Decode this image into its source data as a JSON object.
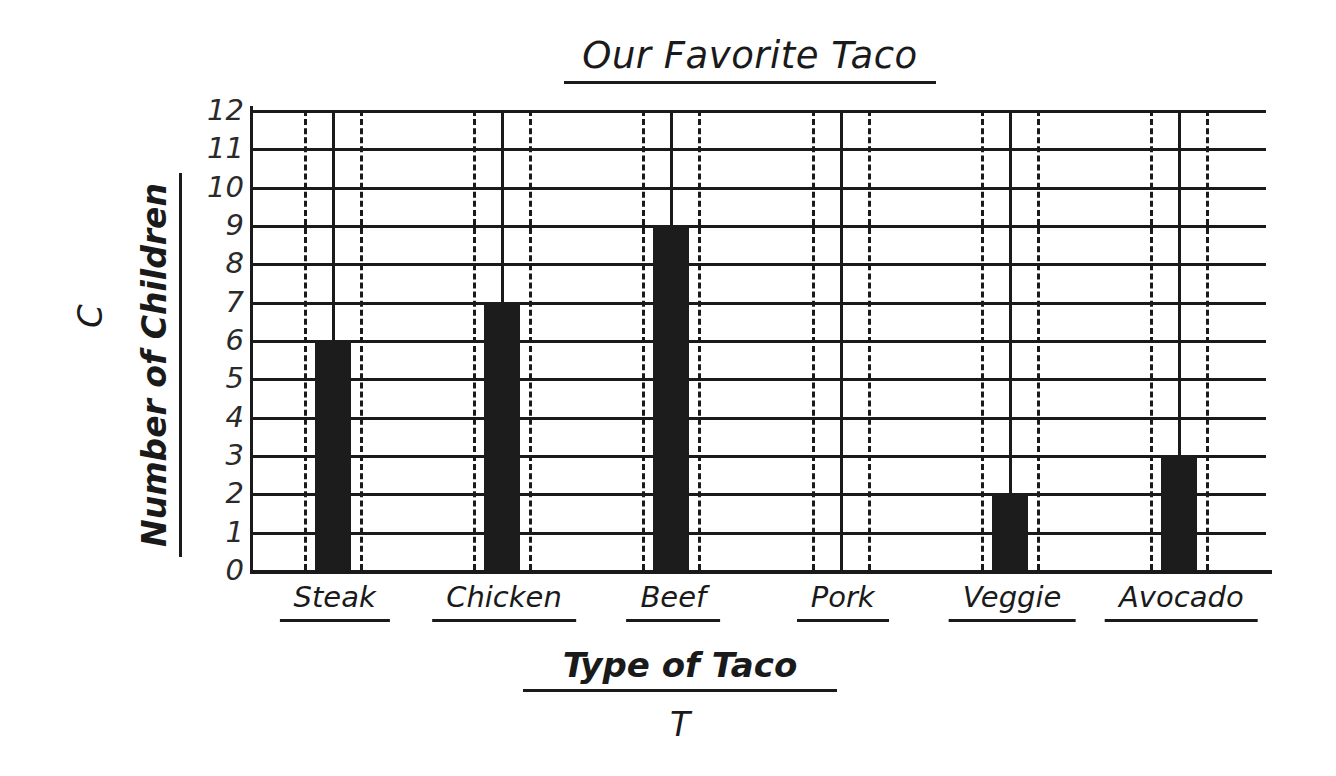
{
  "chart_data": {
    "type": "bar",
    "title": "Our Favorite Taco",
    "xlabel": "Type of Taco",
    "ylabel": "Number of Children",
    "x_variable": "T",
    "y_variable": "C",
    "categories": [
      "Steak",
      "Chicken",
      "Beef",
      "Pork",
      "Veggie",
      "Avocado"
    ],
    "values": [
      6,
      7,
      9,
      0,
      2,
      3
    ],
    "ylim": [
      0,
      12
    ],
    "y_tick_step": 1,
    "y_tick_labels": [
      "12",
      "11",
      "10",
      "9",
      "8",
      "7",
      "6",
      "5",
      "4",
      "3",
      "2",
      "1",
      "0"
    ],
    "grid": true,
    "grid_orientation": "horizontal",
    "legend": "none",
    "bar_color": "#1c1c1c",
    "axis_color": "#1a1a1a",
    "background_color": "#ffffff",
    "guide_lines": {
      "center": "solid",
      "edges": "dashed",
      "note": "each category has one solid vertical center line flanked by two dashed vertical lines at the bar edges, spanning the full plot height"
    }
  }
}
